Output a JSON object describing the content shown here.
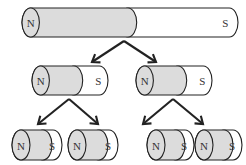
{
  "figure": {
    "colors": {
      "north_fill": "#dcdcdc",
      "south_fill": "#ffffff",
      "outline": "#222222",
      "label": "#333333",
      "arrow": "#222222",
      "background": "#ffffff"
    },
    "labels": {
      "north": "N",
      "south": "S"
    },
    "rows": [
      {
        "row_name": "row-1-original-magnet",
        "count": 1,
        "magnets": [
          {
            "name": "magnet-original",
            "north": "N",
            "south": "S",
            "x": 22,
            "y": 8,
            "w": 216,
            "h": 29,
            "split_x": 128
          }
        ]
      },
      {
        "row_name": "row-2-halves",
        "count": 2,
        "magnets": [
          {
            "name": "magnet-left-half",
            "north": "N",
            "south": "S",
            "x": 32,
            "y": 66,
            "w": 76,
            "h": 29,
            "split_x": 74
          },
          {
            "name": "magnet-right-half",
            "north": "N",
            "south": "S",
            "x": 136,
            "y": 66,
            "w": 76,
            "h": 29,
            "split_x": 178
          }
        ]
      },
      {
        "row_name": "row-3-quarters",
        "count": 4,
        "magnets": [
          {
            "name": "magnet-quarter-1",
            "north": "N",
            "south": "S",
            "x": 12,
            "y": 130,
            "w": 50,
            "h": 30,
            "split_x": 43
          },
          {
            "name": "magnet-quarter-2",
            "north": "N",
            "south": "S",
            "x": 68,
            "y": 130,
            "w": 50,
            "h": 30,
            "split_x": 99
          },
          {
            "name": "magnet-quarter-3",
            "north": "N",
            "south": "S",
            "x": 147,
            "y": 130,
            "w": 47,
            "h": 30,
            "split_x": 176
          },
          {
            "name": "magnet-quarter-4",
            "north": "N",
            "south": "S",
            "x": 195,
            "y": 130,
            "w": 47,
            "h": 30,
            "split_x": 224
          }
        ]
      }
    ],
    "arrow_groups": [
      {
        "name": "arrows-split-1",
        "apex_x": 124,
        "apex_y": 41,
        "left_tip_x": 92,
        "left_tip_y": 62,
        "right_tip_x": 156,
        "right_tip_y": 62
      },
      {
        "name": "arrows-split-2-left",
        "apex_x": 69,
        "apex_y": 99,
        "left_tip_x": 38,
        "left_tip_y": 124,
        "right_tip_x": 98,
        "right_tip_y": 124
      },
      {
        "name": "arrows-split-2-right",
        "apex_x": 173,
        "apex_y": 99,
        "left_tip_x": 143,
        "left_tip_y": 124,
        "right_tip_x": 203,
        "right_tip_y": 124
      }
    ]
  }
}
